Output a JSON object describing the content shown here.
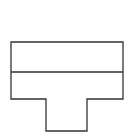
{
  "figure": {
    "shape": "t-shape",
    "stroke_color": "#333333",
    "background_color": "#ffffff",
    "outline_points": "11,42 123,42 123,99 87,99 87,131 46,131 46,99 11,99",
    "divider": {
      "x1": 11,
      "y1": 72,
      "x2": 123,
      "y2": 72
    }
  }
}
